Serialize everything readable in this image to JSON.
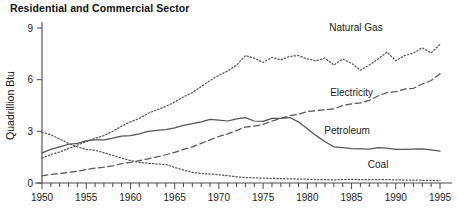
{
  "chart_data": {
    "type": "line",
    "title": "Residential and Commercial Sector",
    "xlabel": "",
    "ylabel": "Quadrillion Btu",
    "xlim": [
      1949,
      1996
    ],
    "ylim": [
      0,
      9.6
    ],
    "yticks": [
      0,
      3,
      6,
      9
    ],
    "ytick_labels": [
      "0",
      "3",
      "6",
      "9"
    ],
    "xticks": [
      1950,
      1955,
      1960,
      1965,
      1970,
      1975,
      1980,
      1985,
      1990,
      1995
    ],
    "xtick_labels": [
      "1950",
      "1955",
      "1960",
      "1965",
      "1970",
      "1975",
      "1980",
      "1985",
      "1990",
      "1995"
    ],
    "x_minor_tick_step": 1,
    "grid": false,
    "legend_position": "inline-annotations",
    "x": [
      1950,
      1951,
      1952,
      1953,
      1954,
      1955,
      1956,
      1957,
      1958,
      1959,
      1960,
      1961,
      1962,
      1963,
      1964,
      1965,
      1966,
      1967,
      1968,
      1969,
      1970,
      1971,
      1972,
      1973,
      1974,
      1975,
      1976,
      1977,
      1978,
      1979,
      1980,
      1981,
      1982,
      1983,
      1984,
      1985,
      1986,
      1987,
      1988,
      1989,
      1990,
      1991,
      1992,
      1993,
      1994,
      1995
    ],
    "series": [
      {
        "name": "Natural Gas",
        "style": "dotted",
        "label": "Natural Gas",
        "label_x": 1985.5,
        "label_y": 8.8,
        "values": [
          1.45,
          1.65,
          1.8,
          2.0,
          2.2,
          2.4,
          2.6,
          2.75,
          3.0,
          3.3,
          3.55,
          3.75,
          4.05,
          4.25,
          4.45,
          4.7,
          5.0,
          5.25,
          5.6,
          5.95,
          6.25,
          6.5,
          6.85,
          7.4,
          7.25,
          7.0,
          7.3,
          7.15,
          7.35,
          7.4,
          7.2,
          7.1,
          7.25,
          6.85,
          7.2,
          6.95,
          6.55,
          6.85,
          7.2,
          7.6,
          7.1,
          7.4,
          7.55,
          7.85,
          7.55,
          8.05
        ]
      },
      {
        "name": "Electricity",
        "style": "dashed",
        "label": "Electricity",
        "label_x": 1985.0,
        "label_y": 5.05,
        "values": [
          0.42,
          0.5,
          0.55,
          0.62,
          0.68,
          0.78,
          0.86,
          0.92,
          1.0,
          1.12,
          1.2,
          1.3,
          1.4,
          1.52,
          1.64,
          1.78,
          1.95,
          2.1,
          2.3,
          2.5,
          2.7,
          2.85,
          3.05,
          3.25,
          3.3,
          3.4,
          3.6,
          3.75,
          3.9,
          4.0,
          4.15,
          4.2,
          4.25,
          4.3,
          4.5,
          4.6,
          4.65,
          4.8,
          5.05,
          5.25,
          5.3,
          5.45,
          5.5,
          5.75,
          5.95,
          6.35
        ]
      },
      {
        "name": "Petroleum",
        "style": "solid",
        "label": "Petroleum",
        "label_x": 1984.5,
        "label_y": 2.85,
        "values": [
          1.75,
          1.95,
          2.1,
          2.25,
          2.3,
          2.45,
          2.5,
          2.5,
          2.6,
          2.72,
          2.75,
          2.85,
          3.0,
          3.05,
          3.1,
          3.2,
          3.35,
          3.45,
          3.55,
          3.7,
          3.65,
          3.6,
          3.72,
          3.8,
          3.6,
          3.58,
          3.75,
          3.75,
          3.8,
          3.55,
          3.15,
          2.75,
          2.4,
          2.1,
          2.05,
          2.0,
          1.98,
          1.97,
          2.05,
          2.02,
          1.95,
          1.95,
          1.97,
          1.98,
          1.93,
          1.85
        ]
      },
      {
        "name": "Coal",
        "style": "dotted",
        "label": "Coal",
        "label_x": 1988.0,
        "label_y": 0.85,
        "values": [
          2.95,
          2.8,
          2.55,
          2.3,
          2.1,
          1.95,
          1.9,
          1.75,
          1.6,
          1.45,
          1.3,
          1.2,
          1.15,
          1.1,
          1.08,
          0.9,
          0.75,
          0.62,
          0.55,
          0.52,
          0.48,
          0.42,
          0.36,
          0.32,
          0.3,
          0.28,
          0.27,
          0.25,
          0.24,
          0.23,
          0.22,
          0.2,
          0.19,
          0.18,
          0.2,
          0.21,
          0.2,
          0.19,
          0.2,
          0.2,
          0.18,
          0.17,
          0.16,
          0.16,
          0.15,
          0.14
        ]
      }
    ]
  },
  "axis": {
    "y_title": "Quadrillion Btu"
  }
}
